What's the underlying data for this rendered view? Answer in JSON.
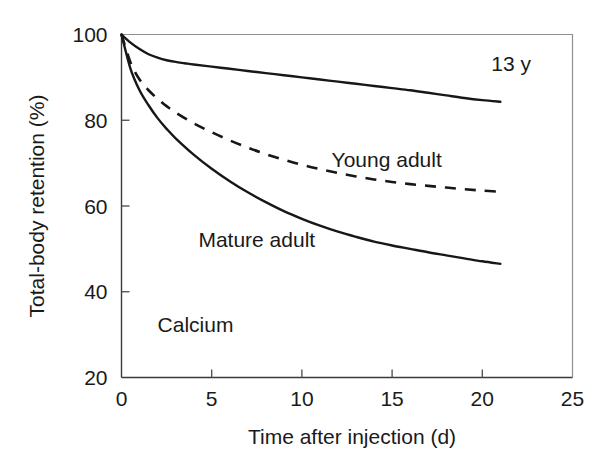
{
  "chart_data": {
    "type": "line",
    "title": "",
    "subtitle": "",
    "xlabel": "Time after injection (d)",
    "ylabel": "Total-body retention (%)",
    "xlim": [
      0,
      25
    ],
    "ylim": [
      20,
      100
    ],
    "xticks": [
      "0",
      "5",
      "10",
      "15",
      "20",
      "25"
    ],
    "xtick_values": [
      0,
      5,
      10,
      15,
      20,
      25
    ],
    "yticks": [
      "20",
      "40",
      "60",
      "80",
      "100"
    ],
    "ytick_values": [
      20,
      40,
      60,
      80,
      100
    ],
    "grid": false,
    "legend_position": "inline-annotations",
    "annotations": [
      {
        "text": "Calcium",
        "x": 2.0,
        "y": 30.5
      }
    ],
    "series": [
      {
        "name": "13 y",
        "style": "solid",
        "color": "#171717",
        "label_x": 21.6,
        "label_y": 91.5,
        "x": [
          0,
          0.5,
          1,
          1.5,
          2,
          2.5,
          3,
          3.5,
          4,
          5,
          6,
          7,
          8,
          9,
          10,
          11,
          12,
          13,
          14,
          15,
          16,
          17,
          18,
          19,
          20,
          21
        ],
        "y": [
          100,
          98.1,
          96.6,
          95.4,
          94.6,
          94.0,
          93.6,
          93.3,
          93.0,
          92.5,
          92.0,
          91.5,
          91.0,
          90.5,
          90.0,
          89.5,
          89.0,
          88.5,
          88.0,
          87.5,
          87.0,
          86.4,
          85.8,
          85.2,
          84.7,
          84.3
        ]
      },
      {
        "name": "Young adult",
        "style": "dashed",
        "color": "#171717",
        "label_x": 14.7,
        "label_y": 69.0,
        "x": [
          0,
          0.5,
          1,
          1.5,
          2,
          2.5,
          3,
          4,
          5,
          6,
          7,
          8,
          9,
          10,
          11,
          12,
          13,
          14,
          15,
          16,
          17,
          18,
          19,
          20,
          21
        ],
        "y": [
          100,
          93.5,
          89.5,
          87.0,
          85.0,
          83.3,
          81.8,
          79.3,
          77.2,
          75.3,
          73.6,
          72.1,
          70.8,
          69.6,
          68.6,
          67.7,
          66.9,
          66.2,
          65.6,
          65.1,
          64.7,
          64.3,
          63.9,
          63.6,
          63.3
        ]
      },
      {
        "name": "Mature adult",
        "style": "solid",
        "color": "#171717",
        "label_x": 7.5,
        "label_y": 50.5,
        "x": [
          0,
          0.5,
          1,
          1.5,
          2,
          2.5,
          3,
          4,
          5,
          6,
          7,
          8,
          9,
          10,
          11,
          12,
          13,
          14,
          15,
          16,
          17,
          18,
          19,
          20,
          21
        ],
        "y": [
          100,
          92.0,
          87.0,
          83.5,
          80.5,
          78.0,
          75.8,
          72.0,
          68.7,
          65.8,
          63.2,
          60.9,
          58.8,
          57.0,
          55.4,
          54.0,
          52.8,
          51.7,
          50.8,
          50.0,
          49.2,
          48.5,
          47.8,
          47.1,
          46.5
        ]
      }
    ]
  }
}
